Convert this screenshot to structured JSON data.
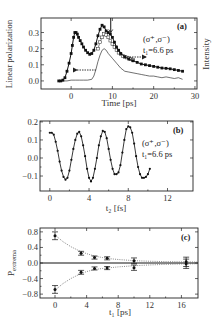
{
  "chart_data": [
    {
      "panel": "a",
      "type": "line",
      "panel_label": "(a)",
      "xlabel": "Time [ps]",
      "ylabel": "Linear polarization",
      "ylabel_right": "Intensity",
      "xlim": [
        -7.3,
        30.5
      ],
      "ylim": [
        -0.05,
        0.39
      ],
      "xticks": [
        0,
        10,
        20,
        30
      ],
      "xtick_labels": [
        "0",
        "10",
        "20",
        "30"
      ],
      "yticks": [
        0.0,
        0.1,
        0.2,
        0.3
      ],
      "ytick_labels": [
        "0.0",
        "0.1",
        "0.2",
        "0.3"
      ],
      "annotation_line1": "(σ⁺,σ⁻)",
      "annotation_line2": "t₁=6.6 ps",
      "marker_at_x": 9.6,
      "series": [
        {
          "name": "Linear polarization",
          "marker": "filled-square",
          "x": [
            -3,
            -2.5,
            -2,
            -1.5,
            -1,
            -0.5,
            0,
            0.3,
            0.6,
            0.9,
            1.2,
            1.5,
            1.8,
            2.2,
            2.6,
            3,
            3.5,
            4,
            4.5,
            5,
            5.5,
            6,
            6.5,
            7,
            7.5,
            8,
            8.5,
            9,
            9.5,
            10,
            10.5,
            11,
            11.5,
            12,
            13,
            14,
            15,
            16,
            17,
            18,
            19,
            20,
            21,
            22,
            23,
            24,
            25,
            26,
            27
          ],
          "y": [
            0.0,
            0.0,
            0.005,
            0.02,
            0.06,
            0.11,
            0.17,
            0.22,
            0.27,
            0.3,
            0.3,
            0.29,
            0.27,
            0.25,
            0.23,
            0.21,
            0.19,
            0.175,
            0.165,
            0.17,
            0.19,
            0.23,
            0.28,
            0.32,
            0.345,
            0.335,
            0.31,
            0.3,
            0.29,
            0.27,
            0.24,
            0.21,
            0.19,
            0.17,
            0.15,
            0.135,
            0.125,
            0.115,
            0.105,
            0.1,
            0.095,
            0.09,
            0.085,
            0.08,
            0.078,
            0.075,
            0.07,
            0.065,
            0.06
          ]
        },
        {
          "name": "Intensity (open)",
          "marker": "open-square",
          "x": [
            6.5,
            7,
            7.5,
            8,
            8.5,
            9,
            9.5,
            10,
            10.5,
            11,
            11.5,
            12,
            12.5,
            13,
            13.5,
            14,
            14.5,
            15
          ],
          "y": [
            0.2,
            0.24,
            0.27,
            0.29,
            0.285,
            0.27,
            0.25,
            0.23,
            0.21,
            0.19,
            0.175,
            0.165,
            0.155,
            0.15,
            0.145,
            0.14,
            0.135,
            0.13
          ]
        },
        {
          "name": "Intensity",
          "marker": "none",
          "x": [
            -3,
            -1,
            0,
            1,
            2,
            3,
            4,
            5,
            5.5,
            6,
            6.5,
            7,
            7.5,
            8,
            8.5,
            9,
            10,
            11,
            12,
            13,
            14,
            15,
            16,
            17,
            18,
            19,
            20,
            21,
            22,
            23,
            24,
            25,
            26,
            27
          ],
          "y": [
            0.0,
            0.0,
            0.005,
            0.005,
            0.005,
            0.005,
            0.005,
            0.01,
            0.03,
            0.07,
            0.12,
            0.16,
            0.19,
            0.2,
            0.19,
            0.17,
            0.14,
            0.11,
            0.08,
            0.06,
            0.055,
            0.05,
            0.045,
            0.04,
            0.035,
            0.03,
            0.03,
            0.025,
            0.02,
            0.025,
            0.02,
            0.015,
            0.02,
            0.01
          ]
        }
      ]
    },
    {
      "panel": "b",
      "type": "line",
      "panel_label": "(b)",
      "xlabel": "t₂ [fs]",
      "ylabel": "",
      "xlim": [
        -1.0,
        14.6
      ],
      "ylim": [
        -0.183,
        0.205
      ],
      "xticks": [
        0,
        4,
        8,
        12
      ],
      "xtick_labels": [
        "0",
        "4",
        "8",
        "12"
      ],
      "yticks": [
        -0.1,
        0.0,
        0.1,
        0.2
      ],
      "ytick_labels": [
        "−0.1",
        "0.0",
        "0.1",
        "0.2"
      ],
      "annotation_line1": "(σ⁺,σ⁻)",
      "annotation_line2": "t₁=6.6 ps",
      "series": [
        {
          "name": "Polarization oscillation",
          "marker": "filled-circle",
          "x": [
            0.0,
            0.2,
            0.4,
            0.6,
            0.8,
            1.0,
            1.2,
            1.4,
            1.6,
            1.8,
            2.0,
            2.2,
            2.4,
            2.6,
            2.8,
            3.0,
            3.2,
            3.4,
            3.6,
            3.8,
            4.0,
            4.2,
            4.4,
            4.6,
            4.8,
            5.0,
            5.2,
            5.4,
            5.6,
            5.8,
            6.0,
            6.2,
            6.4,
            6.6,
            6.8,
            7.0,
            7.2,
            7.4,
            7.6,
            7.8,
            8.0,
            8.2,
            8.4,
            8.6,
            8.8,
            9.0,
            9.2,
            9.4,
            9.6,
            9.8,
            10.0,
            10.2
          ],
          "y": [
            0.14,
            0.14,
            0.13,
            0.09,
            0.04,
            -0.02,
            -0.07,
            -0.105,
            -0.12,
            -0.11,
            -0.07,
            -0.01,
            0.05,
            0.1,
            0.135,
            0.145,
            0.12,
            0.07,
            0.01,
            -0.06,
            -0.11,
            -0.13,
            -0.11,
            -0.06,
            0.0,
            0.07,
            0.12,
            0.15,
            0.145,
            0.11,
            0.05,
            -0.01,
            -0.06,
            -0.09,
            -0.09,
            -0.08,
            -0.04,
            0.03,
            0.1,
            0.16,
            0.175,
            0.17,
            0.14,
            0.08,
            0.01,
            -0.05,
            -0.09,
            -0.11,
            -0.11,
            -0.105,
            -0.09,
            -0.06
          ]
        }
      ]
    },
    {
      "panel": "c",
      "type": "scatter",
      "panel_label": "(c)",
      "xlabel": "t₁ [ps]",
      "ylabel": "P_extrema",
      "xlim": [
        -1.9,
        18.1
      ],
      "ylim": [
        -0.9,
        0.9
      ],
      "xticks": [
        0,
        4,
        8,
        12,
        16
      ],
      "xtick_labels": [
        "0",
        "4",
        "8",
        "12",
        "16"
      ],
      "yticks": [
        -0.8,
        -0.4,
        0.0,
        0.4,
        0.8
      ],
      "ytick_labels": [
        "−0.8",
        "−0.4",
        "0.0",
        "0.4",
        "0.8"
      ],
      "series": [
        {
          "name": "Maxima",
          "marker": "filled-circle-errorbar",
          "x": [
            0.0,
            3.3,
            5.0,
            6.6,
            10.0,
            16.6
          ],
          "y": [
            0.7,
            0.25,
            0.14,
            0.12,
            0.06,
            0.03
          ],
          "err": [
            0.1,
            0.05,
            0.04,
            0.04,
            0.07,
            0.12
          ]
        },
        {
          "name": "Minima",
          "marker": "filled-circle-errorbar",
          "x": [
            0.0,
            3.3,
            5.0,
            6.6,
            10.0,
            16.6
          ],
          "y": [
            -0.68,
            -0.24,
            -0.14,
            -0.13,
            -0.12,
            -0.02
          ],
          "err": [
            0.1,
            0.05,
            0.04,
            0.04,
            0.07,
            0.12
          ]
        },
        {
          "name": "Fit upper",
          "marker": "dotted-line",
          "x": [
            0,
            1,
            2,
            3,
            4,
            5,
            6,
            7,
            8,
            10,
            12,
            14,
            16,
            18
          ],
          "y": [
            0.72,
            0.55,
            0.42,
            0.32,
            0.24,
            0.18,
            0.14,
            0.11,
            0.09,
            0.06,
            0.045,
            0.035,
            0.03,
            0.025
          ]
        },
        {
          "name": "Fit lower",
          "marker": "dotted-line",
          "x": [
            0,
            1,
            2,
            3,
            4,
            5,
            6,
            7,
            8,
            10,
            12,
            14,
            16,
            18
          ],
          "y": [
            -0.7,
            -0.53,
            -0.4,
            -0.3,
            -0.22,
            -0.17,
            -0.14,
            -0.12,
            -0.1,
            -0.07,
            -0.05,
            -0.035,
            -0.025,
            -0.02
          ]
        }
      ]
    }
  ]
}
